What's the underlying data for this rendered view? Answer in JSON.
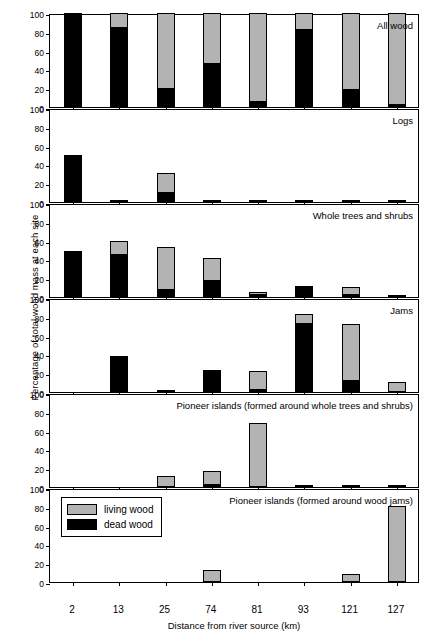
{
  "chart_data": {
    "type": "bar",
    "title": "",
    "xlabel": "Distance from river source (km)",
    "ylabel": "Percentage of total wood mass at each site",
    "categories": [
      "2",
      "13",
      "25",
      "74",
      "81",
      "93",
      "121",
      "127"
    ],
    "ylim": [
      0,
      100
    ],
    "yticks": [
      0,
      20,
      40,
      60,
      80,
      100
    ],
    "grid": false,
    "stacked": true,
    "legend": {
      "position": "bottom-left",
      "entries": [
        {
          "name": "living wood",
          "color": "#b3b3b3"
        },
        {
          "name": "dead wood",
          "color": "#000000"
        }
      ]
    },
    "panels": [
      {
        "title": "All wood",
        "series": [
          {
            "name": "dead wood",
            "color": "#000000",
            "values": [
              100,
              84,
              19,
              46,
              5,
              82,
              18,
              2
            ]
          },
          {
            "name": "living wood",
            "color": "#b3b3b3",
            "values": [
              0,
              16,
              81,
              54,
              95,
              18,
              82,
              98
            ]
          }
        ]
      },
      {
        "title": "Logs",
        "series": [
          {
            "name": "dead wood",
            "color": "#000000",
            "values": [
              50,
              1,
              10,
              2,
              2,
              1,
              2,
              1
            ]
          },
          {
            "name": "living wood",
            "color": "#b3b3b3",
            "values": [
              0,
              0,
              21,
              0,
              0,
              0,
              0,
              0
            ]
          }
        ]
      },
      {
        "title": "Whole trees and shrubs",
        "series": [
          {
            "name": "dead wood",
            "color": "#000000",
            "values": [
              49,
              45,
              7,
              17,
              1,
              10,
              2,
              1
            ]
          },
          {
            "name": "living wood",
            "color": "#b3b3b3",
            "values": [
              0,
              15,
              46,
              25,
              3,
              2,
              8,
              0
            ]
          }
        ]
      },
      {
        "title": "Jams",
        "series": [
          {
            "name": "dead wood",
            "color": "#000000",
            "values": [
              0,
              38,
              1,
              23,
              1,
              72,
              12,
              0
            ]
          },
          {
            "name": "living wood",
            "color": "#b3b3b3",
            "values": [
              0,
              0,
              0,
              0,
              20,
              11,
              60,
              11
            ]
          }
        ]
      },
      {
        "title": "Pioneer islands (formed around whole trees and shrubs)",
        "series": [
          {
            "name": "dead wood",
            "color": "#000000",
            "values": [
              0,
              0,
              0,
              2,
              0,
              0,
              0,
              0
            ]
          },
          {
            "name": "living wood",
            "color": "#b3b3b3",
            "values": [
              0,
              0,
              12,
              15,
              68,
              2,
              2,
              2
            ]
          }
        ]
      },
      {
        "title": "Pioneer islands (formed around wood jams)",
        "series": [
          {
            "name": "dead wood",
            "color": "#000000",
            "values": [
              0,
              0,
              0,
              0,
              0,
              0,
              0,
              0
            ]
          },
          {
            "name": "living wood",
            "color": "#b3b3b3",
            "values": [
              0,
              0,
              0,
              13,
              0,
              0,
              9,
              81
            ]
          }
        ]
      }
    ]
  }
}
